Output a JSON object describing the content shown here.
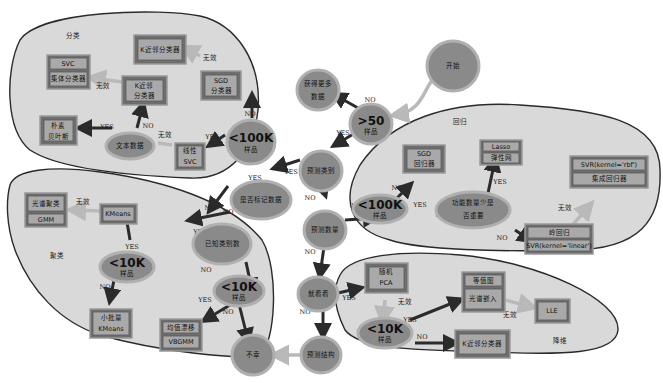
{
  "colors": {
    "region_fill": "#d9d9d9",
    "node_fill": "#8a8a8a",
    "box_fill": "#6e6e6e",
    "box_inner": "#a9a9a9",
    "yes_no_arrow": "#2b2b2b",
    "fallback_arrow": "#b9b9b9"
  },
  "regions": {
    "classification": "分类",
    "regression": "回归",
    "clustering": "聚类",
    "dimensionality_reduction": "降维"
  },
  "decisions": {
    "start": "开始",
    "gt50_big": ">50",
    "gt50_small": "样品",
    "get_more_data_1": "获得更多",
    "get_more_data_2": "数据",
    "predict_category": "预测类别",
    "labeled_data": "是否标记数据",
    "predict_quantity": "预测数量",
    "just_looking": "就看看",
    "predict_structure": "预测结构",
    "tough_luck": "不幸",
    "cls_lt100k_big": "<100K",
    "cls_lt100k_small": "样品",
    "text_data": "文本数据",
    "reg_lt100k_big": "<100K",
    "reg_lt100k_small": "样品",
    "few_features_1": "功能数量少是",
    "few_features_2": "否重要",
    "known_categories": "已知类别数",
    "clu_lt10k_a_big": "<10K",
    "clu_lt10k_a_small": "样品",
    "clu_lt10k_b_big": "<10K",
    "clu_lt10k_b_small": "样品",
    "dim_lt10k_big": "<10K",
    "dim_lt10k_small": "样品"
  },
  "estimators": {
    "kneighbors_cls": "K近邻分类器",
    "sgd_cls_1": "SGD",
    "sgd_cls_2": "分类器",
    "svc": "SVC",
    "ensemble_cls": "集体分类器",
    "kneighbors_cls2_1": "K近邻",
    "kneighbors_cls2_2": "分类器",
    "naive_bayes_1": "朴素",
    "naive_bayes_2": "贝叶斯",
    "linear_svc_1": "线性",
    "linear_svc_2": "SVC",
    "sgd_reg_1": "SGD",
    "sgd_reg_2": "回归器",
    "lasso": "Lasso",
    "elasticnet": "弹性网",
    "svr_rbf": "SVR(kernel='rbf')",
    "ensemble_reg": "集成回归器",
    "ridge": "岭回归",
    "svr_linear": "SVR(kernel='linear')",
    "spectral": "光谱聚类",
    "gmm": "GMM",
    "kmeans": "KMeans",
    "minibatch_1": "小批量",
    "minibatch_2": "KMeans",
    "meanshift": "均值漂移",
    "vbgmm": "VBGMM",
    "random_pca_1": "随机",
    "random_pca_2": "PCA",
    "isomap": "等值图",
    "spectral_embedding": "光谱嵌入",
    "lle": "LLE",
    "kneighbors_dim": "K近邻分类器"
  },
  "edge_labels": {
    "yes": "YES",
    "no": "NO",
    "not_working": "无效"
  }
}
